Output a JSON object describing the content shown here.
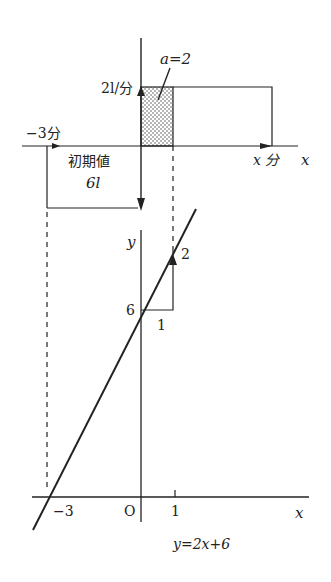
{
  "upper_graph": {
    "rate_label": "2l/分",
    "a_label": "a=2",
    "minus3_label": "−3分",
    "initial_label_line1": "初期値",
    "initial_label_line2": "6l",
    "x_minutes_label": "x 分",
    "x_axis_label": "x"
  },
  "lower_graph": {
    "y_axis_label": "y",
    "intercept_label": "6",
    "rise_label": "2",
    "run_label": "1",
    "origin_label": "O",
    "tick_minus3": "−3",
    "tick_1": "1",
    "x_axis_label": "x",
    "equation": "y=2x+6"
  },
  "colors": {
    "ink": "#222222",
    "background": "#ffffff"
  }
}
